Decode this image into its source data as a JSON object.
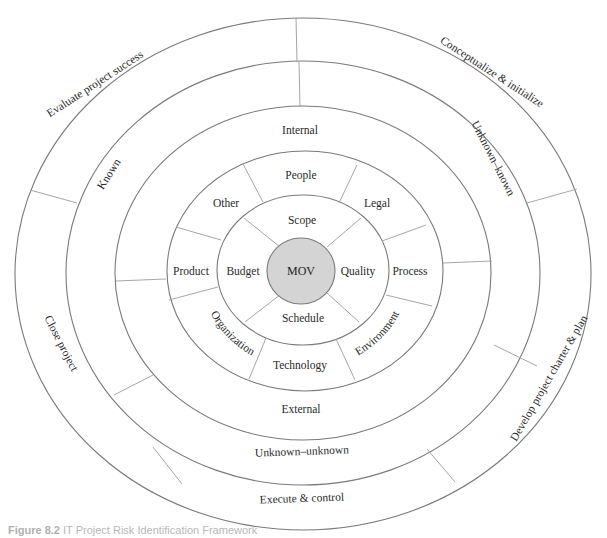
{
  "figure": {
    "caption_label": "Figure 8.2",
    "caption_text": "IT Project Risk Identification Framework"
  },
  "diagram": {
    "center": "MOV",
    "project_objectives": [
      "Scope",
      "Quality",
      "Schedule",
      "Budget"
    ],
    "risk_sources": [
      "People",
      "Legal",
      "Process",
      "Environment",
      "Technology",
      "Organization",
      "Product",
      "Other"
    ],
    "internal_external": [
      "Internal",
      "External"
    ],
    "knowledge": [
      "Known",
      "Unknown–known",
      "Unknown–unknown"
    ],
    "phases": [
      "Evaluate project success",
      "Conceptualize & initialize",
      "Develop project charter & plan",
      "Execute & control",
      "Close project"
    ]
  },
  "colors": {
    "line": "#7a7a7a",
    "divider": "#a6a6a6",
    "mov_fill": "#d4d4d4",
    "text": "#2a2a2a"
  }
}
